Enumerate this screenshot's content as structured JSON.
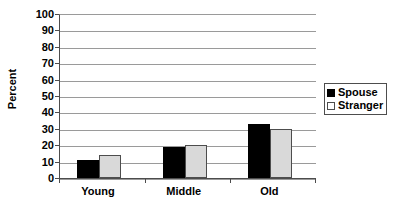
{
  "chart_data": {
    "type": "bar",
    "title": "",
    "subtitle": "",
    "xlabel": "",
    "ylabel": "Percent",
    "categories": [
      "Young",
      "Middle",
      "Old"
    ],
    "series": [
      {
        "name": "Spouse",
        "values": [
          11,
          19,
          33
        ],
        "color": "#000000"
      },
      {
        "name": "Stranger",
        "values": [
          14,
          20,
          30
        ],
        "color": "#d9d9d9"
      }
    ],
    "ylim": [
      0,
      100
    ],
    "ytick_labels": [
      "100",
      "90",
      "80",
      "70",
      "60",
      "50",
      "40",
      "30",
      "20",
      "10",
      "0"
    ],
    "ytick_values": [
      100,
      90,
      80,
      70,
      60,
      50,
      40,
      30,
      20,
      10,
      0
    ],
    "grid": true,
    "grid_axis": "y",
    "legend_position": "right",
    "legend": [
      {
        "label": "Spouse",
        "swatch": "filled-black-square"
      },
      {
        "label": "Stranger",
        "swatch": "outlined-white-square"
      }
    ]
  },
  "colors": {
    "spouse": "#000000",
    "stranger": "#d9d9d9",
    "gridline": "#9a9a9a",
    "axis": "#4d4d4d",
    "background": "#ffffff",
    "text": "#000000"
  }
}
